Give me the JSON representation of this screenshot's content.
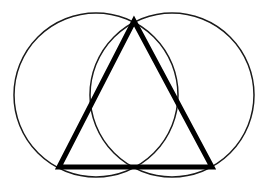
{
  "figure": {
    "background_color": "#ffffff",
    "canvas": {
      "width": 267,
      "height": 190
    },
    "shapes": {
      "left_circle": {
        "name": "left-circle",
        "cx": 96,
        "cy": 95,
        "r": 82,
        "stroke_color": "#1a1a1a",
        "stroke_width": 1.5,
        "fill": "none"
      },
      "right_circle": {
        "name": "right-circle",
        "cx": 172,
        "cy": 95,
        "r": 82,
        "stroke_color": "#1a1a1a",
        "stroke_width": 1.5,
        "fill": "none"
      },
      "triangle": {
        "name": "triangle",
        "points": "134,21 212,167 59,167",
        "apex": {
          "x": 134,
          "y": 21
        },
        "bottom_left": {
          "x": 59,
          "y": 167
        },
        "bottom_right": {
          "x": 212,
          "y": 167
        },
        "stroke_color": "#000000",
        "stroke_width": 5,
        "fill": "none"
      }
    }
  }
}
